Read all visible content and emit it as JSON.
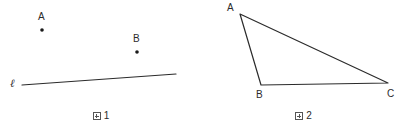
{
  "figures": [
    {
      "id": "figure-1",
      "caption_glyph": "tofu-box",
      "caption_text": "1",
      "caption_full": "図 1",
      "points": [
        {
          "name": "A",
          "label": "A",
          "x": 42,
          "y": 30,
          "label_x": 38,
          "label_y": 12
        },
        {
          "name": "B",
          "label": "B",
          "x": 137,
          "y": 52,
          "label_x": 133,
          "label_y": 34
        }
      ],
      "lines": [
        {
          "name": "line-l",
          "label": "ℓ",
          "x1": 22,
          "y1": 85,
          "x2": 176,
          "y2": 74,
          "label_x": 10,
          "label_y": 78
        }
      ]
    },
    {
      "id": "figure-2",
      "caption_glyph": "tofu-box",
      "caption_text": "2",
      "caption_full": "図 2",
      "shape": "triangle",
      "vertices": [
        {
          "name": "A",
          "label": "A",
          "x": 38,
          "y": 14,
          "label_x": 25,
          "label_y": 3
        },
        {
          "name": "B",
          "label": "B",
          "x": 59,
          "y": 85,
          "label_x": 54,
          "label_y": 90
        },
        {
          "name": "C",
          "label": "C",
          "x": 186,
          "y": 83,
          "label_x": 185,
          "label_y": 89
        }
      ]
    }
  ],
  "style": {
    "stroke_color": "#2b2b2b",
    "stroke_width": 1.2,
    "point_color": "#1a1a1a",
    "point_radius": 1.8,
    "background": "#ffffff"
  }
}
